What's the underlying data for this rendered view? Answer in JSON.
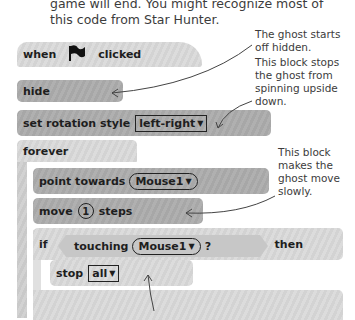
{
  "intro_text": "game will end. You might recognize most of this code from Star Hunter.",
  "annotations": {
    "ghost_hidden": "The ghost starts off hidden.",
    "rotation": "This block stops the ghost from spinning upside down.",
    "slow": "This block makes the ghost move slowly."
  },
  "blocks": {
    "when_clicked": {
      "when": "when",
      "clicked": "clicked",
      "icon": "green-flag-icon"
    },
    "hide": "hide",
    "set_rotation": {
      "label": "set rotation style",
      "value": "left-right"
    },
    "forever": "forever",
    "point_towards": {
      "label": "point towards",
      "value": "Mouse1"
    },
    "move": {
      "label": "move",
      "value": "1",
      "suffix": "steps"
    },
    "if_block": {
      "if": "if",
      "condition": "touching",
      "value": "Mouse1",
      "question": "?",
      "then": "then"
    },
    "stop": {
      "label": "stop",
      "value": "all"
    }
  },
  "dropdown_glyph": "▼"
}
